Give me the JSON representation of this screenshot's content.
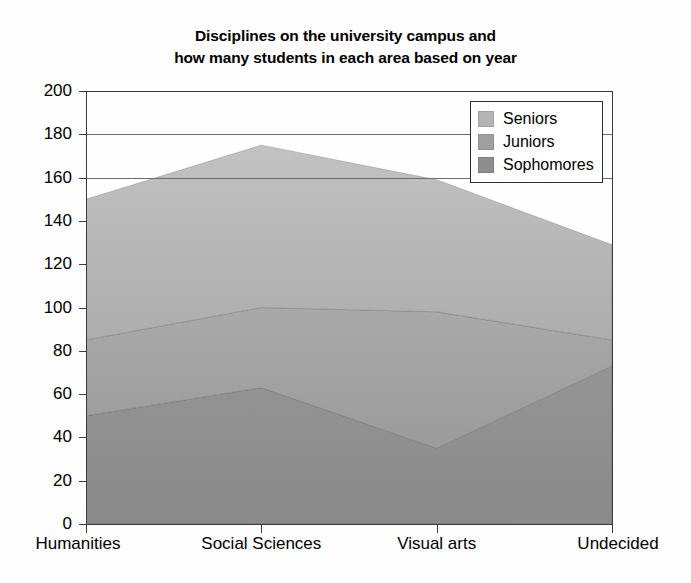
{
  "chart_data": {
    "type": "area",
    "title": "Disciplines on the university campus and how many students in each area based on year",
    "title_lines": [
      "Disciplines on the university campus and",
      "how many students in each area based on year"
    ],
    "stacked": true,
    "categories": [
      "Humanities",
      "Social Sciences",
      "Visual arts",
      "Undecided"
    ],
    "series": [
      {
        "name": "Sophomores",
        "values": [
          50,
          63,
          35,
          73
        ],
        "color": "#8e8e8e"
      },
      {
        "name": "Juniors",
        "values": [
          35,
          37,
          63,
          12
        ],
        "color": "#a0a0a0"
      },
      {
        "name": "Seniors",
        "values": [
          65,
          75,
          61,
          44
        ],
        "color": "#b4b4b4"
      }
    ],
    "cumulative": {
      "Sophomores": [
        50,
        63,
        35,
        73
      ],
      "Juniors": [
        85,
        100,
        98,
        85
      ],
      "Seniors": [
        150,
        175,
        159,
        129
      ]
    },
    "xlabel": "",
    "ylabel": "",
    "ylim": [
      0,
      200
    ],
    "yticks": [
      0,
      20,
      40,
      60,
      80,
      100,
      120,
      140,
      160,
      180,
      200
    ],
    "ytick_labels": [
      "0",
      "20",
      "40",
      "60",
      "80",
      "100",
      "120",
      "140",
      "160",
      "180",
      "200"
    ],
    "gridlines": [
      160,
      180,
      200
    ],
    "grid": true,
    "legend_position": "top-right",
    "legend_entries": [
      "Seniors",
      "Juniors",
      "Sophomores"
    ]
  },
  "legend": {
    "items": [
      {
        "label": "Seniors",
        "color": "#b4b4b4"
      },
      {
        "label": "Juniors",
        "color": "#a0a0a0"
      },
      {
        "label": "Sophomores",
        "color": "#8e8e8e"
      }
    ]
  }
}
